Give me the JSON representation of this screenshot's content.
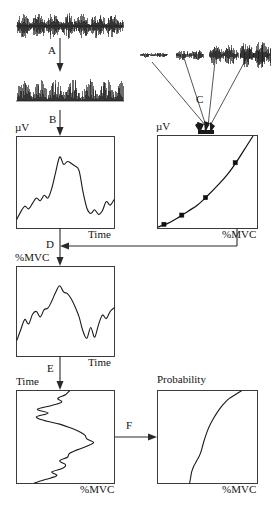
{
  "figure": {
    "type": "flow-diagram",
    "steps": [
      {
        "id": "A",
        "label": "A",
        "meaning": "full-wave rectification of raw EMG"
      },
      {
        "id": "B",
        "label": "B",
        "meaning": "linear envelope / low-pass filter"
      },
      {
        "id": "C",
        "label": "C",
        "meaning": "calibration bursts at increasing contraction levels"
      },
      {
        "id": "D",
        "label": "D",
        "meaning": "amplitude to %MVC conversion using calibration curve"
      },
      {
        "id": "E",
        "label": "E",
        "meaning": "axis transposition: time vs %MVC"
      },
      {
        "id": "F",
        "label": "F",
        "meaning": "cumulative amplitude probability distribution"
      }
    ]
  },
  "panels": {
    "raw_emg": {
      "name": "raw-emg-signal",
      "caption": ""
    },
    "rectified_emg": {
      "name": "rectified-emg-signal",
      "caption": ""
    },
    "calibration_bursts": {
      "name": "calibration-emg-bursts",
      "count": 4
    },
    "envelope_plot": {
      "ylabel": "µV",
      "xlabel": "Time"
    },
    "calibration_plot": {
      "ylabel": "µV",
      "xlabel": "%MVC"
    },
    "mvc_time_plot": {
      "ylabel": "%MVC",
      "xlabel": "Time"
    },
    "transposed_plot": {
      "ylabel": "Time",
      "xlabel": "%MVC"
    },
    "probability_plot": {
      "ylabel": "Probability",
      "xlabel": "%MVC"
    }
  },
  "labels": {
    "microvolt": "µV",
    "time": "Time",
    "mvc": "%MVC",
    "probability": "Probability",
    "a": "A",
    "b": "B",
    "c": "C",
    "d": "D",
    "e": "E",
    "f": "F"
  },
  "chart_data": [
    {
      "type": "line",
      "name": "envelope-plot",
      "title": "",
      "ylabel": "µV",
      "xlabel": "Time",
      "grid": false,
      "xlim": [
        0,
        100
      ],
      "ylim": [
        0,
        100
      ],
      "x": [
        0,
        4,
        8,
        12,
        16,
        20,
        24,
        28,
        32,
        36,
        40,
        44,
        48,
        52,
        56,
        60,
        64,
        68,
        72,
        76,
        80,
        84,
        88,
        92,
        96,
        100
      ],
      "y": [
        10,
        18,
        24,
        21,
        27,
        33,
        30,
        36,
        33,
        44,
        62,
        78,
        70,
        73,
        71,
        68,
        63,
        40,
        22,
        16,
        20,
        15,
        19,
        29,
        25,
        31
      ]
    },
    {
      "type": "scatter",
      "name": "calibration-plot",
      "title": "",
      "ylabel": "µV",
      "xlabel": "%MVC",
      "grid": false,
      "xlim": [
        0,
        100
      ],
      "ylim": [
        0,
        100
      ],
      "points_x": [
        6,
        24,
        48,
        78
      ],
      "points_y": [
        4,
        14,
        33,
        71
      ],
      "fit": "exponential",
      "fit_x": [
        0,
        10,
        20,
        30,
        40,
        50,
        60,
        70,
        80,
        90,
        96
      ],
      "fit_y": [
        1,
        5,
        11,
        18,
        25,
        35,
        46,
        58,
        73,
        90,
        100
      ]
    },
    {
      "type": "line",
      "name": "mvc-time-plot",
      "title": "",
      "ylabel": "%MVC",
      "xlabel": "Time",
      "grid": false,
      "xlim": [
        0,
        100
      ],
      "ylim": [
        0,
        100
      ],
      "x": [
        0,
        4,
        8,
        12,
        16,
        20,
        24,
        28,
        32,
        36,
        40,
        44,
        48,
        52,
        56,
        60,
        64,
        68,
        72,
        76,
        80,
        84,
        88,
        92,
        96,
        100
      ],
      "y": [
        18,
        30,
        41,
        36,
        47,
        50,
        44,
        52,
        54,
        62,
        72,
        79,
        72,
        70,
        64,
        55,
        44,
        28,
        20,
        32,
        21,
        35,
        46,
        42,
        50,
        54
      ]
    },
    {
      "type": "line",
      "name": "transposed-plot",
      "title": "",
      "ylabel": "Time",
      "xlabel": "%MVC",
      "grid": false,
      "xlim": [
        0,
        100
      ],
      "ylim": [
        0,
        100
      ],
      "x": [
        54,
        50,
        42,
        46,
        35,
        21,
        32,
        20,
        28,
        44,
        55,
        64,
        70,
        72,
        79,
        72,
        62,
        54,
        52,
        44,
        50,
        47,
        36,
        41,
        30,
        18
      ],
      "y": [
        0,
        4,
        8,
        12,
        16,
        20,
        24,
        28,
        32,
        36,
        40,
        44,
        48,
        52,
        56,
        60,
        64,
        68,
        72,
        76,
        80,
        84,
        88,
        92,
        96,
        100
      ]
    },
    {
      "type": "line",
      "name": "probability-plot",
      "title": "",
      "ylabel": "Probability",
      "xlabel": "%MVC",
      "grid": false,
      "xlim": [
        0,
        100
      ],
      "ylim": [
        0,
        100
      ],
      "x": [
        32,
        33,
        34,
        36,
        38,
        40,
        42,
        44,
        46,
        49,
        52,
        56,
        60,
        64,
        68,
        72,
        78,
        84
      ],
      "y": [
        0,
        6,
        12,
        18,
        22,
        26,
        30,
        36,
        44,
        54,
        62,
        70,
        77,
        83,
        88,
        92,
        96,
        100
      ]
    }
  ]
}
